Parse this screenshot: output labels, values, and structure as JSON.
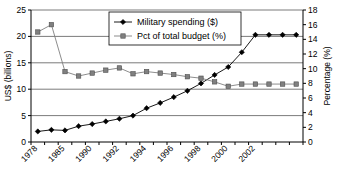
{
  "chart_data": {
    "type": "line",
    "title": "",
    "xlabel": "",
    "ylabel": "US$ (billions)",
    "y2label": "Percentage (%)",
    "ylim": [
      0,
      25
    ],
    "y2lim": [
      0,
      18
    ],
    "grid": true,
    "legend_position": "top-center",
    "categories": [
      "1978",
      "1979",
      "1985",
      "1986",
      "1988",
      "1989",
      "1990",
      "1991",
      "1992",
      "1993",
      "1994",
      "1995",
      "1996",
      "1997",
      "1998",
      "1999",
      "2000",
      "2001",
      "2002",
      "2003"
    ],
    "xtick_labels": [
      "1978",
      "1985",
      "1990",
      "1992",
      "1994",
      "1996",
      "1998",
      "2000",
      "2002"
    ],
    "ytick_labels": [
      "0",
      "5",
      "10",
      "15",
      "20",
      "25"
    ],
    "y2tick_labels": [
      "0",
      "2",
      "4",
      "6",
      "8",
      "10",
      "12",
      "14",
      "16",
      "18"
    ],
    "series": [
      {
        "name": "Military spending ($)",
        "axis": "left",
        "marker": "diamond",
        "color": "#000000",
        "values": [
          2.0,
          2.3,
          2.2,
          3.0,
          3.4,
          3.9,
          4.4,
          5.0,
          6.4,
          7.4,
          8.5,
          9.7,
          11.1,
          12.7,
          14.2,
          17.0,
          20.3,
          20.3,
          20.3,
          20.3
        ]
      },
      {
        "name": "Pct of total budget (%)",
        "axis": "right",
        "marker": "square",
        "color": "#808080",
        "values": [
          15.0,
          16.0,
          9.6,
          9.0,
          9.4,
          9.8,
          10.1,
          9.3,
          9.6,
          9.4,
          9.2,
          8.9,
          8.7,
          8.2,
          7.6,
          7.9,
          7.9,
          7.9,
          7.9,
          7.9
        ]
      }
    ],
    "legend": [
      {
        "label": "Military spending ($)",
        "marker": "diamond",
        "color": "#000000"
      },
      {
        "label": "Pct of total budget (%)",
        "marker": "square",
        "color": "#808080"
      }
    ]
  }
}
